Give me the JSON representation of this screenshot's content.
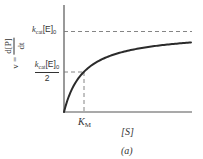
{
  "chart_data": {
    "type": "line",
    "title": "",
    "panel_label": "(a)",
    "xlabel": "[S]",
    "ylabel": "v = d[P]/dt",
    "ylabel_parts": {
      "lhs": "v =",
      "numerator": "d[P]",
      "denominator": "dt"
    },
    "y_ticks": [
      {
        "label": "k_cat[E]_0",
        "relative_value": 1.0,
        "style": "dashed"
      },
      {
        "label": "k_cat[E]_0 / 2",
        "relative_value": 0.5,
        "style": "dashed"
      }
    ],
    "x_ticks": [
      {
        "label": "K_M",
        "relative_value": 1.0,
        "style": "dashed"
      }
    ],
    "series": [
      {
        "name": "Michaelis-Menten rate",
        "equation": "v = Vmax*[S]/(K_M + [S])",
        "x": [
          0,
          0.5,
          1,
          2,
          3,
          4,
          5,
          6.35
        ],
        "y": [
          0,
          0.333,
          0.5,
          0.667,
          0.75,
          0.8,
          0.833,
          0.864
        ]
      }
    ],
    "axis_ranges": {
      "x": [
        0,
        6.35
      ],
      "y": [
        0,
        1.2
      ]
    },
    "grid": false,
    "legend": "none",
    "colors": {
      "curve": "#2b2b2b",
      "axes": "#555555",
      "dashed": "#777777"
    }
  },
  "labels": {
    "ymax_k": "k",
    "ymax_sub": "cat",
    "ymax_E": "[E]",
    "ymax_sub0": "0",
    "yhalf_k": "k",
    "yhalf_sub": "cat",
    "yhalf_E": "[E]",
    "yhalf_sub0": "0",
    "yhalf_den": "2",
    "km_K": "K",
    "km_sub": "M",
    "xlabel": "[S]",
    "panel": "(a)",
    "ylabel_lhs": "v =",
    "ylabel_num": "d[P]",
    "ylabel_den": "dt"
  }
}
